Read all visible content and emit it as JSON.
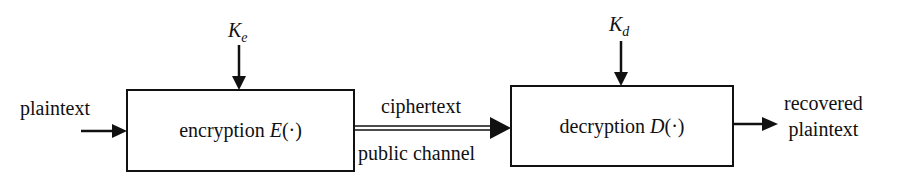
{
  "diagram": {
    "nodes": {
      "encryption": {
        "label": "encryption",
        "func": "E",
        "arg": "(·)"
      },
      "decryption": {
        "label": "decryption",
        "func": "D",
        "arg": "(·)"
      }
    },
    "keys": {
      "encrypt_key": {
        "symbol": "K",
        "subscript": "e"
      },
      "decrypt_key": {
        "symbol": "K",
        "subscript": "d"
      }
    },
    "edges": {
      "input": "plaintext",
      "channel_top": "ciphertext",
      "channel_bottom": "public channel",
      "output_line1": "recovered",
      "output_line2": "plaintext"
    },
    "colors": {
      "stroke": "#111111",
      "background": "#ffffff"
    }
  }
}
